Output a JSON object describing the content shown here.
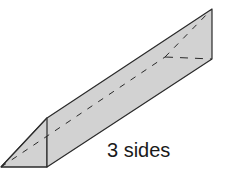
{
  "diagram": {
    "label": "3 sides",
    "colors": {
      "face_fill": "#d2d2d2",
      "edge_stroke": "#2a2a2a",
      "background": "#ffffff"
    },
    "vertices": {
      "front_bottom_left": [
        1,
        167
      ],
      "front_bottom_right": [
        47,
        167
      ],
      "front_top": [
        47,
        118
      ],
      "back_top": [
        212,
        9
      ],
      "back_bottom_right": [
        212,
        59
      ],
      "back_hidden": [
        165,
        57
      ]
    }
  }
}
